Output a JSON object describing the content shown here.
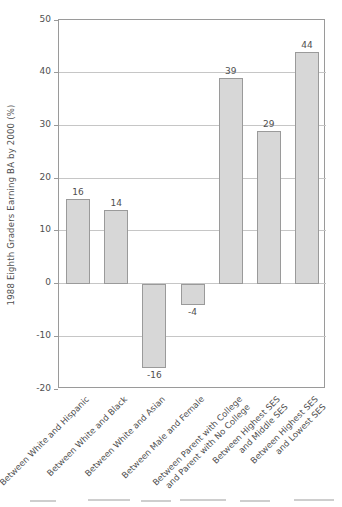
{
  "chart_data": {
    "type": "bar",
    "title": "",
    "xlabel": "",
    "ylabel": "1988 Eighth Graders Earning BA by 2000 (%)",
    "categories": [
      "Between White and Hispanic",
      "Between White and Black",
      "Between White and Asian",
      "Between Male and Female",
      "Between Parent with College\nand Parent with No College",
      "Between Highest SES\nand Middle SES",
      "Between Highest SES\nand Lowest SES"
    ],
    "values": [
      16,
      14,
      -16,
      -4,
      39,
      29,
      44
    ],
    "value_labels": [
      "16",
      "14",
      "-16",
      "-4",
      "39",
      "29",
      "44"
    ],
    "ylim": [
      -20,
      50
    ],
    "yticks": [
      50,
      40,
      30,
      20,
      10,
      0,
      -10,
      -20
    ],
    "grid": true,
    "legend_position": "none",
    "colors": {
      "bar_fill": "#d7d7d7",
      "bar_border": "#9a9a9a",
      "gridline": "#c6c6c6",
      "axis_box": "#9a9a9a",
      "text": "#4f4f4f"
    }
  }
}
